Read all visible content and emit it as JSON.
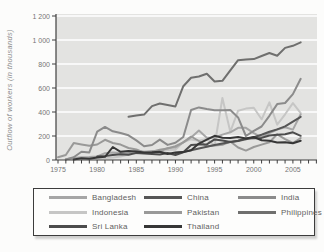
{
  "chart_data": {
    "type": "line",
    "title": "",
    "xlabel": "",
    "ylabel": "Outflow of workers (in thousands)",
    "ylim": [
      0,
      1200
    ],
    "y_ticks": [
      0,
      200,
      400,
      600,
      800,
      1000,
      1200
    ],
    "y_tick_labels": [
      "0",
      "200",
      "400",
      "600",
      "800",
      "1 000",
      "1 200"
    ],
    "x_major_tick_years": [
      1975,
      1980,
      1985,
      1990,
      1995,
      2000,
      2005
    ],
    "x_major_tick_labels": [
      "1975",
      "1980",
      "1985",
      "1990",
      "1995",
      "2000",
      "2005"
    ],
    "minor_ticks_every_year": true,
    "minor_tick_year_start": 1975,
    "minor_tick_year_end": 2008,
    "grid": "horizontal-white-lines-on-gray-panel",
    "panel_color": "#e3e3e1",
    "gridline_color": "#ffffff",
    "axis_color": "#3f3f3f",
    "legend_position": "bottom-boxed",
    "x": [
      1975,
      1976,
      1977,
      1978,
      1979,
      1980,
      1981,
      1982,
      1983,
      1984,
      1985,
      1986,
      1987,
      1988,
      1989,
      1990,
      1991,
      1992,
      1993,
      1994,
      1995,
      1996,
      1997,
      1998,
      1999,
      2000,
      2001,
      2002,
      2003,
      2004,
      2005,
      2006
    ],
    "series": [
      {
        "name": "Bangladesh",
        "slug": "bangladesh",
        "color": "#a6a6a6",
        "values": [
          null,
          6,
          16,
          23,
          24,
          30,
          56,
          63,
          59,
          57,
          78,
          69,
          74,
          68,
          101,
          104,
          147,
          188,
          245,
          186,
          188,
          212,
          231,
          268,
          268,
          223,
          189,
          225,
          254,
          273,
          253,
          381
        ]
      },
      {
        "name": "China",
        "slug": "china",
        "color": "#565656",
        "values": [
          null,
          null,
          null,
          null,
          null,
          null,
          null,
          null,
          null,
          null,
          null,
          null,
          null,
          null,
          null,
          58,
          66,
          82,
          96,
          110,
          124,
          138,
          151,
          159,
          173,
          190,
          210,
          235,
          255,
          280,
          320,
          360
        ]
      },
      {
        "name": "India",
        "slug": "india",
        "color": "#8b8b8b",
        "values": [
          null,
          4,
          23,
          69,
          63,
          236,
          276,
          239,
          225,
          206,
          163,
          114,
          125,
          170,
          126,
          144,
          192,
          417,
          438,
          425,
          415,
          414,
          416,
          355,
          200,
          243,
          279,
          368,
          466,
          475,
          549,
          677
        ]
      },
      {
        "name": "Indonesia",
        "slug": "indonesia",
        "color": "#c6c6c5",
        "values": [
          null,
          null,
          null,
          null,
          10,
          16,
          17,
          21,
          29,
          46,
          54,
          68,
          61,
          61,
          84,
          86,
          150,
          172,
          160,
          176,
          121,
          517,
          235,
          411,
          428,
          435,
          339,
          480,
          294,
          381,
          474,
          390
        ]
      },
      {
        "name": "Pakistan",
        "slug": "pakistan",
        "color": "#999998",
        "values": [
          23,
          42,
          141,
          130,
          118,
          129,
          168,
          142,
          128,
          100,
          88,
          62,
          68,
          85,
          96,
          116,
          147,
          196,
          158,
          114,
          122,
          127,
          154,
          104,
          78,
          108,
          128,
          148,
          214,
          174,
          142,
          183
        ]
      },
      {
        "name": "Philippines",
        "slug": "philippines",
        "color": "#6f6f6e",
        "values": [
          null,
          null,
          null,
          null,
          null,
          null,
          null,
          null,
          null,
          360,
          372,
          378,
          449,
          471,
          458,
          446,
          615,
          686,
          696,
          719,
          654,
          660,
          747,
          832,
          837,
          841,
          867,
          892,
          868,
          934,
          952,
          980
        ]
      },
      {
        "name": "Sri Lanka",
        "slug": "sri-lanka",
        "color": "#4c4c4c",
        "values": [
          null,
          null,
          null,
          null,
          null,
          28,
          33,
          41,
          48,
          44,
          59,
          54,
          50,
          45,
          58,
          42,
          65,
          124,
          130,
          130,
          172,
          162,
          150,
          160,
          180,
          182,
          184,
          204,
          210,
          214,
          231,
          202
        ]
      },
      {
        "name": "Thailand",
        "slug": "thailand",
        "color": "#363636",
        "values": [
          null,
          null,
          4,
          14,
          10,
          21,
          27,
          108,
          68,
          75,
          70,
          62,
          64,
          68,
          50,
          63,
          66,
          81,
          137,
          169,
          202,
          185,
          183,
          191,
          180,
          192,
          165,
          160,
          147,
          148,
          140,
          161
        ]
      }
    ],
    "draw_order": [
      "indonesia",
      "bangladesh",
      "pakistan",
      "india",
      "philippines",
      "china",
      "sri-lanka",
      "thailand"
    ]
  }
}
